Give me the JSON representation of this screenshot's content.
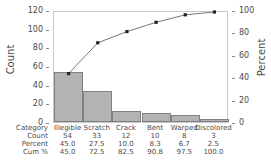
{
  "chart_data": {
    "type": "bar",
    "title": "",
    "categories": [
      "Illegible",
      "Scratch",
      "Crack",
      "Bent",
      "Warped",
      "Discolored"
    ],
    "values": [
      54,
      33,
      12,
      10,
      8,
      3
    ],
    "series": [
      {
        "name": "Count",
        "values": [
          54,
          33,
          12,
          10,
          8,
          3
        ]
      },
      {
        "name": "Cum %",
        "values": [
          45.0,
          72.5,
          82.5,
          90.8,
          97.5,
          100.0
        ]
      }
    ],
    "percent": [
      45.0,
      27.5,
      10.0,
      8.3,
      6.7,
      2.5
    ],
    "cum_percent": [
      45.0,
      72.5,
      82.5,
      90.8,
      97.5,
      100.0
    ],
    "xlabel": "",
    "ylabel": "Count",
    "y2label": "Percent",
    "ylim": [
      0,
      120
    ],
    "y2lim": [
      0,
      100
    ],
    "yticks": [
      0,
      20,
      40,
      60,
      80,
      100,
      120
    ],
    "y2ticks": [
      0,
      20,
      40,
      60,
      80,
      100
    ],
    "ytick_labels": [
      "0",
      "20",
      "40",
      "60",
      "80",
      "100",
      "120"
    ],
    "y2tick_labels": [
      "0",
      "20",
      "40",
      "60",
      "80",
      "100"
    ],
    "grid": false,
    "legend": "none",
    "bar_color": "#b3b3b3",
    "bar_border_color": "#808080",
    "line_color": "#555555",
    "marker_color": "#222222",
    "axis_color": "#c8c8c8",
    "text_color": "#4a4a4a"
  },
  "axes": {
    "left_title": "Count",
    "right_title": "Percent"
  },
  "table": {
    "rows": [
      {
        "label": "Category",
        "values": [
          "Illegible",
          "Scratch",
          "Crack",
          "Bent",
          "Warped",
          "Discolored"
        ]
      },
      {
        "label": "Count",
        "values": [
          "54",
          "33",
          "12",
          "10",
          "8",
          "3"
        ]
      },
      {
        "label": "Percent",
        "values": [
          "45.0",
          "27.5",
          "10.0",
          "8.3",
          "6.7",
          "2.5"
        ]
      },
      {
        "label": "Cum %",
        "values": [
          "45.0",
          "72.5",
          "82.5",
          "90.8",
          "97.5",
          "100.0"
        ]
      }
    ]
  }
}
